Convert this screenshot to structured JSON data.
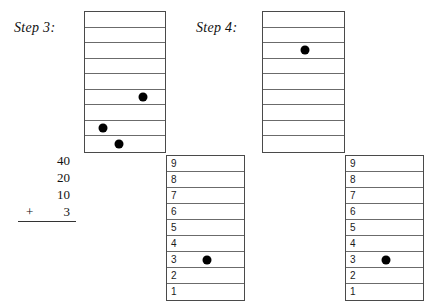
{
  "figure": {
    "background_color": "#ffffff",
    "ink_color": "#000000",
    "line_color": "#6b6b6b"
  },
  "steps": [
    {
      "id": "step3",
      "label": "Step 3:",
      "grid": {
        "rows": 9,
        "beads": [
          {
            "row": 6,
            "x_percent": 72
          },
          {
            "row": 8,
            "x_percent": 23
          },
          {
            "row": 9,
            "x_percent": 42
          }
        ]
      },
      "addition": {
        "addends": [
          "40",
          "20",
          "10"
        ],
        "operator": "+",
        "last_addend": "3"
      },
      "table": {
        "row_labels": [
          "9",
          "8",
          "7",
          "6",
          "5",
          "4",
          "3",
          "2",
          "1"
        ],
        "beads": [
          {
            "row_label": "3",
            "x_percent": 52
          }
        ]
      }
    },
    {
      "id": "step4",
      "label": "Step 4:",
      "grid": {
        "rows": 9,
        "beads": [
          {
            "row": 3,
            "x_percent": 52
          }
        ]
      },
      "table": {
        "row_labels": [
          "9",
          "8",
          "7",
          "6",
          "5",
          "4",
          "3",
          "2",
          "1"
        ],
        "beads": [
          {
            "row_label": "3",
            "x_percent": 52
          }
        ]
      }
    }
  ]
}
